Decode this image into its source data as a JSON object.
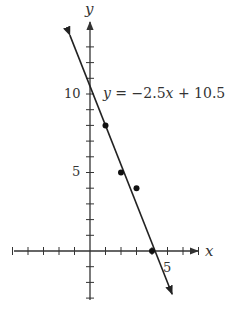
{
  "chart_data": {
    "type": "scatter",
    "title": "",
    "xlabel": "x",
    "ylabel": "y",
    "xlim": [
      -5,
      7
    ],
    "ylim": [
      -3,
      13
    ],
    "x_tick_step": 1,
    "y_tick_step": 1,
    "x_tick_labels": [
      {
        "value": 5,
        "label": "5"
      }
    ],
    "y_tick_labels": [
      {
        "value": 5,
        "label": "5"
      },
      {
        "value": 10,
        "label": "10"
      }
    ],
    "grid": false,
    "series": [
      {
        "name": "data points",
        "type": "scatter",
        "points": [
          {
            "x": 1,
            "y": 8
          },
          {
            "x": 2,
            "y": 5
          },
          {
            "x": 3,
            "y": 4
          },
          {
            "x": 4,
            "y": 0
          }
        ]
      },
      {
        "name": "regression line",
        "type": "line",
        "equation": "y = −2.5x + 10.5",
        "slope": -2.5,
        "intercept": 10.5,
        "x_range": [
          -1.3,
          5.3
        ]
      }
    ],
    "annotations": [
      {
        "text_parts": [
          "y",
          " = −2.5",
          "x",
          " + 10.5"
        ],
        "x": 0.8,
        "y": 10.1
      }
    ]
  },
  "labels": {
    "x_axis": "x",
    "y_axis": "y",
    "tick_x5": "5",
    "tick_y5": "5",
    "tick_y10": "10",
    "eq_y": "y",
    "eq_mid": " = −2.5",
    "eq_x": "x",
    "eq_end": " + 10.5"
  },
  "colors": {
    "axis": "#333333",
    "line": "#222222",
    "points": "#111111",
    "background": "#ffffff"
  }
}
